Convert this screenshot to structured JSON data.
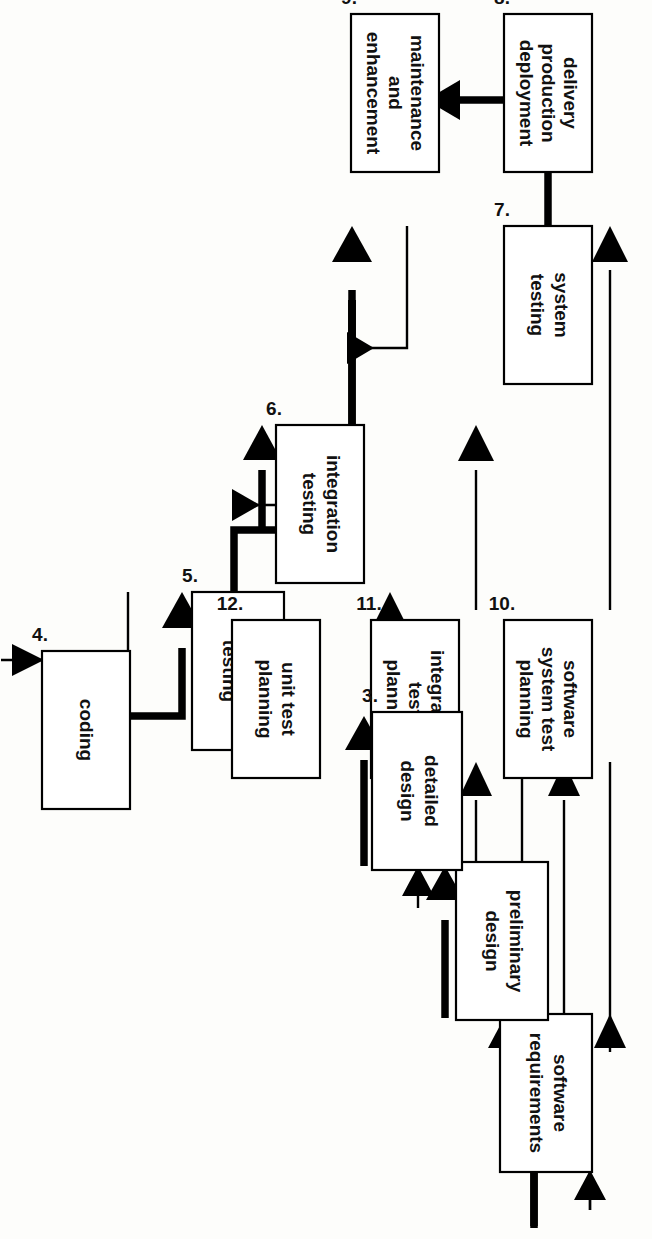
{
  "diagram": {
    "orientation": "rotated-90-ccw",
    "background_color": "#fdfdfb",
    "line_color": "#000000",
    "box_fill": "#ffffff",
    "boxes": [
      {
        "id": "b1",
        "number": "1.",
        "lines": [
          "software",
          "requirements"
        ]
      },
      {
        "id": "b2",
        "number": "2.",
        "lines": [
          "preliminary",
          "design"
        ]
      },
      {
        "id": "b3",
        "number": "3.",
        "lines": [
          "detailed",
          "design"
        ]
      },
      {
        "id": "b4",
        "number": "4.",
        "lines": [
          "coding"
        ]
      },
      {
        "id": "b5",
        "number": "5.",
        "lines": [
          "unit",
          "testing"
        ]
      },
      {
        "id": "b6",
        "number": "6.",
        "lines": [
          "integration",
          "testing"
        ]
      },
      {
        "id": "b7",
        "number": "7.",
        "lines": [
          "system",
          "testing"
        ]
      },
      {
        "id": "b8",
        "number": "8.",
        "lines": [
          "delivery",
          "production",
          "deployment"
        ]
      },
      {
        "id": "b9",
        "number": "9.",
        "lines": [
          "maintenance",
          "and",
          "enhancement"
        ]
      },
      {
        "id": "b10",
        "number": "10.",
        "lines": [
          "software",
          "system test",
          "planning"
        ]
      },
      {
        "id": "b11",
        "number": "11.",
        "lines": [
          "integration",
          "test",
          "planning"
        ]
      },
      {
        "id": "b12",
        "number": "12.",
        "lines": [
          "unit test",
          "planning"
        ]
      }
    ],
    "connections": [
      {
        "from": "1",
        "to": "2",
        "style": "thick"
      },
      {
        "from": "2",
        "to": "1",
        "style": "thin"
      },
      {
        "from": "2",
        "to": "3",
        "style": "thick"
      },
      {
        "from": "3",
        "to": "2",
        "style": "thin"
      },
      {
        "from": "3",
        "to": "4",
        "style": "thick"
      },
      {
        "from": "4",
        "to": "3",
        "style": "thin"
      },
      {
        "from": "4",
        "to": "5",
        "style": "thick"
      },
      {
        "from": "5",
        "to": "4",
        "style": "thin"
      },
      {
        "from": "5",
        "to": "6",
        "style": "thick"
      },
      {
        "from": "6",
        "to": "5",
        "style": "thin"
      },
      {
        "from": "6",
        "to": "7",
        "style": "thick"
      },
      {
        "from": "7",
        "to": "6",
        "style": "thin"
      },
      {
        "from": "7",
        "to": "8",
        "style": "thick"
      },
      {
        "from": "8",
        "to": "9",
        "style": "thick"
      },
      {
        "from": "1",
        "to": "10",
        "style": "thin"
      },
      {
        "from": "10",
        "to": "1",
        "style": "thin"
      },
      {
        "from": "2",
        "to": "11",
        "style": "thin"
      },
      {
        "from": "11",
        "to": "2",
        "style": "thin"
      },
      {
        "from": "3",
        "to": "12",
        "style": "thin"
      },
      {
        "from": "12",
        "to": "3",
        "style": "thin"
      },
      {
        "from": "10",
        "to": "7",
        "style": "thin"
      },
      {
        "from": "11",
        "to": "6",
        "style": "thin"
      },
      {
        "from": "12",
        "to": "5",
        "style": "thin"
      }
    ]
  }
}
